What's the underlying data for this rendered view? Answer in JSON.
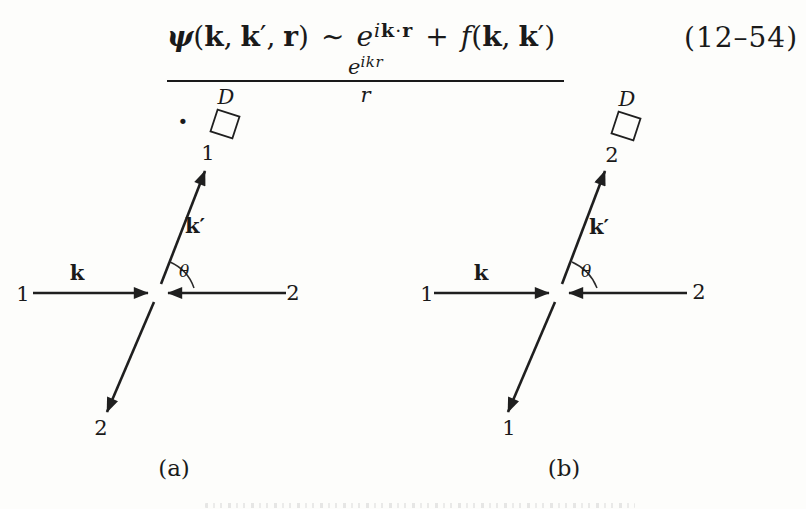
{
  "equation": {
    "psi": "ψ",
    "open1": "(",
    "k1": "k",
    "comma1": ",",
    "k2": "k",
    "prime1": "′",
    "comma2": ",",
    "r1": "r",
    "close1": ")",
    "tilde": "∼",
    "e1": "e",
    "exp_i": "i",
    "exp_k": "k",
    "exp_dot": "·",
    "exp_r": "r",
    "plus": "+",
    "f": "f",
    "open2": "(",
    "k3": "k",
    "comma3": ",",
    "k4": "k",
    "prime2": "′",
    "close2": ")",
    "num_e": "e",
    "num_exp": "ikr",
    "den_r": "r",
    "end_dot": "·",
    "number": "(12–54)"
  },
  "diagram_a": {
    "detector_label": "D",
    "outgoing_top_particle": "1",
    "scattered_momentum": "k′",
    "angle": "θ",
    "incoming_left_particle": "1",
    "incoming_momentum": "k",
    "incoming_right_particle": "2",
    "outgoing_bottom_particle": "2",
    "caption": "(a)"
  },
  "diagram_b": {
    "detector_label": "D",
    "outgoing_top_particle": "2",
    "scattered_momentum": "k′",
    "angle": "θ",
    "incoming_left_particle": "1",
    "incoming_momentum": "k",
    "incoming_right_particle": "2",
    "outgoing_bottom_particle": "1",
    "caption": "(b)"
  }
}
